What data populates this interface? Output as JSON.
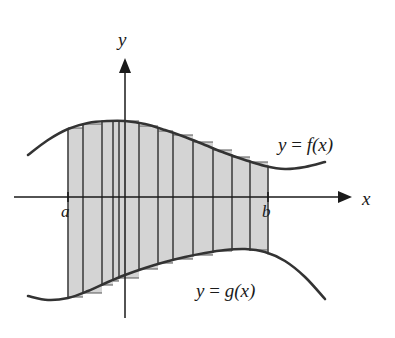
{
  "figure": {
    "background_color": "#ffffff",
    "width": 395,
    "height": 338
  },
  "axes": {
    "x_axis": {
      "label": "x",
      "y_pixel": 197,
      "x_start": 14,
      "x_end": 352,
      "arrow": "right-arrow",
      "label_x": 362,
      "label_y": 189
    },
    "y_axis": {
      "label": "y",
      "x_pixel": 125,
      "y_start": 318,
      "y_end": 58,
      "arrow": "up-arrow",
      "label_x": 118,
      "label_y": 30
    },
    "origin": {
      "x": 125,
      "y": 197
    }
  },
  "bounds": {
    "lower": {
      "label": "a",
      "x_pixel": 68,
      "label_x": 61,
      "label_y": 203
    },
    "upper": {
      "label": "b",
      "x_pixel": 268,
      "label_x": 262,
      "label_y": 203
    }
  },
  "curves": {
    "upper": {
      "name": "f",
      "label": "y = f(x)",
      "label_parts": {
        "lhs": "y",
        "op": "=",
        "rhs": "f(x)"
      },
      "label_x": 278,
      "label_y": 135,
      "color": "#333333",
      "stroke_width": 2.6
    },
    "lower": {
      "name": "g",
      "label": "y = g(x)",
      "label_parts": {
        "lhs": "y",
        "op": "=",
        "rhs": "g(x)"
      },
      "label_x": 196,
      "label_y": 281,
      "color": "#333333",
      "stroke_width": 2.6
    }
  },
  "region": {
    "fill_color": "#d4d4d4",
    "divider_color": "#4a4a4a",
    "rectangle_edge_color": "#555555",
    "divider_x_positions": [
      68,
      83,
      102,
      113,
      119,
      139,
      158,
      173,
      193,
      213,
      232,
      250,
      268
    ],
    "rectangle_count": 12
  },
  "chart_data": {
    "type": "area",
    "xlabel": "x",
    "ylabel": "y",
    "legend": [
      "y = f(x)",
      "y = g(x)"
    ],
    "annotations": [
      "a",
      "b"
    ],
    "grid": false,
    "series": [
      {
        "name": "y = f(x)",
        "points": [
          [
            28,
            155
          ],
          [
            48,
            140
          ],
          [
            68,
            129
          ],
          [
            88,
            123
          ],
          [
            108,
            121
          ],
          [
            125,
            121
          ],
          [
            145,
            124
          ],
          [
            165,
            130
          ],
          [
            185,
            137
          ],
          [
            205,
            145
          ],
          [
            225,
            153
          ],
          [
            245,
            160
          ],
          [
            265,
            166
          ],
          [
            285,
            169
          ],
          [
            305,
            167
          ],
          [
            325,
            162
          ]
        ]
      },
      {
        "name": "y = g(x)",
        "points": [
          [
            28,
            296
          ],
          [
            48,
            300
          ],
          [
            68,
            298
          ],
          [
            88,
            291
          ],
          [
            108,
            282
          ],
          [
            125,
            275
          ],
          [
            145,
            268
          ],
          [
            165,
            262
          ],
          [
            185,
            257
          ],
          [
            205,
            253
          ],
          [
            225,
            250
          ],
          [
            245,
            249
          ],
          [
            265,
            252
          ],
          [
            285,
            261
          ],
          [
            305,
            277
          ],
          [
            325,
            299
          ]
        ]
      }
    ],
    "rectangles": [
      {
        "x0": 68,
        "x1": 83,
        "top": 128,
        "bottom": 297
      },
      {
        "x0": 83,
        "x1": 102,
        "top": 124,
        "bottom": 293
      },
      {
        "x0": 102,
        "x1": 113,
        "top": 121,
        "bottom": 285
      },
      {
        "x0": 113,
        "x1": 119,
        "top": 121,
        "bottom": 281
      },
      {
        "x0": 119,
        "x1": 139,
        "top": 121,
        "bottom": 278
      },
      {
        "x0": 139,
        "x1": 158,
        "top": 126,
        "bottom": 269
      },
      {
        "x0": 158,
        "x1": 173,
        "top": 131,
        "bottom": 263
      },
      {
        "x0": 173,
        "x1": 193,
        "top": 135,
        "bottom": 259
      },
      {
        "x0": 193,
        "x1": 213,
        "top": 142,
        "bottom": 255
      },
      {
        "x0": 213,
        "x1": 232,
        "top": 150,
        "bottom": 251
      },
      {
        "x0": 232,
        "x1": 250,
        "top": 157,
        "bottom": 249
      },
      {
        "x0": 250,
        "x1": 268,
        "top": 162,
        "bottom": 250
      }
    ]
  }
}
